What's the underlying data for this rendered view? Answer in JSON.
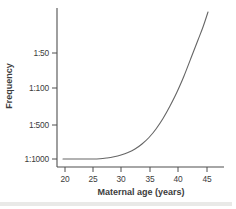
{
  "figure": {
    "background": "#ffffff",
    "ink_color": "#4f4f4f",
    "text_color": "#3c3c3c",
    "curve_color": "#666666",
    "bottom_edge_strip_color": "#e4e4e1"
  },
  "chart_data": {
    "type": "line",
    "title": "",
    "xlabel": "Maternal age (years)",
    "ylabel": "Frequency",
    "x_ticks": [
      20,
      25,
      30,
      35,
      40,
      45
    ],
    "y_tick_labels": [
      "1:50",
      "1:100",
      "1:500",
      "1:1000"
    ],
    "y_scale_note": "stylized ratio scale, ticks equally spaced",
    "grid": false,
    "legend": "none",
    "series": [
      {
        "name": "frequency-vs-maternal-age",
        "points": [
          {
            "age": 20,
            "frequency": "1:1000"
          },
          {
            "age": 25,
            "frequency": "1:1000"
          },
          {
            "age": 28,
            "frequency": "1:1000"
          },
          {
            "age": 30,
            "frequency": "1:900"
          },
          {
            "age": 33,
            "frequency": "1:600"
          },
          {
            "age": 35,
            "frequency": "1:400"
          },
          {
            "age": 38,
            "frequency": "1:180"
          },
          {
            "age": 40,
            "frequency": "1:110"
          },
          {
            "age": 43,
            "frequency": "1:50"
          },
          {
            "age": 45,
            "frequency": "1:30"
          }
        ]
      }
    ],
    "geometry_px": {
      "y_axis": {
        "x": 57,
        "top": 8,
        "bottom": 167
      },
      "x_axis": {
        "y": 167,
        "left": 57,
        "right": 224
      },
      "tick_len": 5,
      "y_ticks": [
        {
          "label": "1:50",
          "y": 53
        },
        {
          "label": "1:100",
          "y": 88
        },
        {
          "label": "1:500",
          "y": 125
        },
        {
          "label": "1:1000",
          "y": 159
        }
      ],
      "x_ticks": [
        {
          "label": "20",
          "x": 65
        },
        {
          "label": "25",
          "x": 93
        },
        {
          "label": "30",
          "x": 121
        },
        {
          "label": "35",
          "x": 150
        },
        {
          "label": "40",
          "x": 178
        },
        {
          "label": "45",
          "x": 207
        }
      ],
      "curve_points": [
        [
          63,
          159
        ],
        [
          78,
          159
        ],
        [
          92,
          159
        ],
        [
          100,
          158.8
        ],
        [
          107,
          158
        ],
        [
          114,
          156.8
        ],
        [
          121,
          155
        ],
        [
          128,
          152.5
        ],
        [
          135,
          149
        ],
        [
          142,
          144
        ],
        [
          149,
          137.5
        ],
        [
          156,
          129
        ],
        [
          163,
          118.5
        ],
        [
          170,
          106
        ],
        [
          177,
          92
        ],
        [
          184,
          76
        ],
        [
          191,
          58
        ],
        [
          198,
          40
        ],
        [
          203,
          27
        ],
        [
          208,
          12
        ]
      ],
      "bottom_strip": {
        "x": 0,
        "y": 202,
        "width": 232,
        "height": 4
      }
    }
  }
}
